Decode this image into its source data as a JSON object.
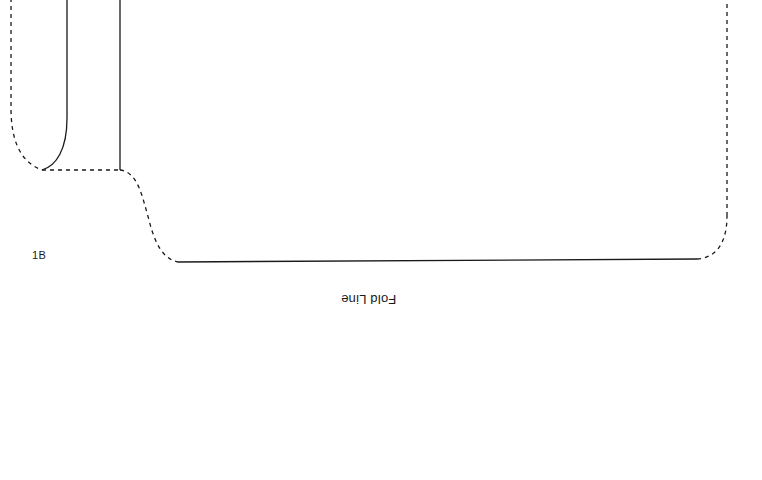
{
  "document": {
    "type": "sewing-pattern-piece",
    "background_color": "#ffffff",
    "width": 762,
    "height": 480,
    "orientation": "rotated-180"
  },
  "labels": {
    "piece_id": "1B",
    "fold_line": "Fold Line"
  },
  "colors": {
    "ink": "#1a1a1a",
    "paper": "#ffffff"
  },
  "line_styles": {
    "cutting_line": "dashed",
    "stitching_line": "solid",
    "dash_pattern": "4 4",
    "stroke_width": 1.3
  },
  "geometry": {
    "left_cut_edge": {
      "style": "dashed",
      "path": "M 11 -10 L 11 108 C 11 140 20 162 42 170"
    },
    "inner_seam_left": {
      "style": "solid",
      "path": "M 67 -10 L 67 118 C 67 150 56 166 42 170"
    },
    "inner_seam_right": {
      "style": "solid",
      "path": "M 120 -10 L 120 170"
    },
    "top_cut_edge_horizontal": {
      "style": "dashed",
      "path": "M 42 170 L 120 170"
    },
    "s_curve_cut_edge": {
      "style": "dashed",
      "path": "M 120 170 C 138 172 142 196 149 220 C 155 244 163 259 178 262"
    },
    "fold_edge_bottom": {
      "style": "solid",
      "path": "M 178 262 L 697 259"
    },
    "right_corner_cut_edge": {
      "style": "dashed",
      "path": "M 697 259 C 716 258 727 243 727 216"
    },
    "right_cut_edge": {
      "style": "dashed",
      "path": "M 727 216 L 727 -10"
    }
  }
}
